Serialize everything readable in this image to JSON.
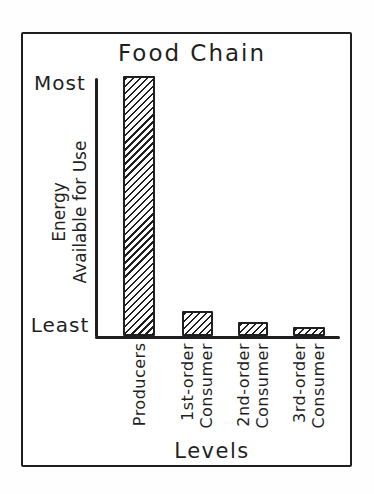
{
  "figure": {
    "background": "#ffffff",
    "ink_color": "#1f1f1f"
  },
  "chart_data": {
    "type": "bar",
    "title": "Food Chain",
    "xlabel": "Levels",
    "ylabel_line1": "Energy",
    "ylabel_line2": "Available for Use",
    "ytick_top": "Most",
    "ytick_bottom": "Least",
    "categories": [
      "Producers",
      "1st-order\nConsumer",
      "2nd-order\nConsumer",
      "3rd-order\nConsumer"
    ],
    "values_pct_of_max": [
      100,
      9.6,
      5.4,
      3.5
    ],
    "y_axis_scale": "qualitative, from Least (bottom) to Most (top)",
    "bar_fill": "black diagonal hatch (/) on white",
    "grid": false,
    "legend": "none"
  }
}
